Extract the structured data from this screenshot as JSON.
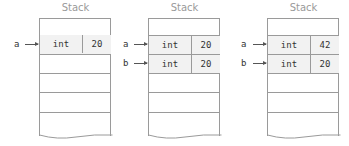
{
  "stacks": [
    {
      "title": "Stack",
      "vars": [
        {
          "name": "a",
          "type": "int",
          "value": "20"
        }
      ]
    },
    {
      "title": "Stack",
      "vars": [
        {
          "name": "a",
          "type": "int",
          "value": "20"
        },
        {
          "name": "b",
          "type": "int",
          "value": "20"
        }
      ]
    },
    {
      "title": "Stack",
      "vars": [
        {
          "name": "a",
          "type": "int",
          "value": "42"
        },
        {
          "name": "b",
          "type": "int",
          "value": "20"
        }
      ]
    }
  ],
  "colors": {
    "border": "#9a9a9a",
    "filled_cell": "#f2f2f2",
    "text": "#333333",
    "title": "#9a9a9a"
  }
}
